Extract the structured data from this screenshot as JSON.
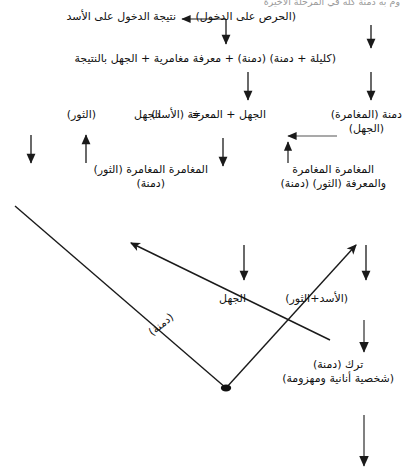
{
  "document": {
    "language": "ar",
    "direction": "rtl",
    "ink_color": "#111111",
    "background_color": "#ffffff",
    "cut_off_top_line": "وم به دمنة كله في المرحلة الأخيرة"
  },
  "nodes": {
    "row1_result": "نتيجة الدخول على الأسد",
    "row1_eagerness": "(الحرص على الدخول)",
    "row2": "(كليلة + دمنة)   (دمنة) + معرفة مغامرية + الجهل بالنتيجة",
    "row3_damna_adventure": "دمنة (المغامرة)",
    "row3_ignorance_paren": "(الجهل)",
    "row3_equation_left": "الجهل  +  المعرفة (الأسد)",
    "row3_equals": "=",
    "row3_ignorance": "الجهل",
    "row3_bull": "(الثور)",
    "row4_right_line1": "المغامرة  المغامرة",
    "row4_right_line2": "والمعرفة (الثور) (دمنة)",
    "row4_left_line1": "المغامرة المغامرة (الثور)",
    "row4_left_line2": "(دمنة)",
    "mid_ignorance": "الجهل",
    "lion_and_bull": "(الأسد+الثور)",
    "diagonal_damna": "(دمنة)",
    "abandon_line1": "ترك (دمنة)",
    "abandon_line2": "(شخصية أنانية ومهزومة)"
  },
  "connectors": {
    "arrow_left_to_eagerness": "horizontal-left-arrow",
    "arrow_down_row1_to_row2_center": "down-arrow",
    "arrow_down_row1_to_row2_right": "down-arrow",
    "arrow_down_row2_to_row3_center": "down-arrow",
    "arrow_down_row2_to_row3_right": "down-arrow",
    "arrow_left_row3": "horizontal-left-arrow",
    "arrow_up_into_row3": "up-arrow",
    "arrow_down_far_left": "down-arrow",
    "arrow_up_row4_left": "up-arrow",
    "arrow_down_row4_center": "down-arrow",
    "arrow_up_row4_right": "up-arrow",
    "arrow_down_to_mid_ignorance": "down-arrow",
    "arrow_down_to_lion_bull": "down-arrow",
    "arrow_down_to_abandon": "down-arrow",
    "arrow_down_bottom": "down-arrow",
    "v_shape_left_branch": "long-diagonal-line",
    "v_shape_right_branch": "diagonal-arrow-up-right",
    "inner_diagonal_arrow": "diagonal-arrow-up-left",
    "vertex_marker": "filled-dot"
  }
}
